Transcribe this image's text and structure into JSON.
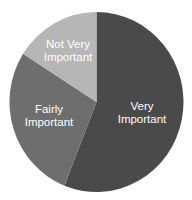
{
  "chart_data": {
    "type": "pie",
    "title": "",
    "categories": [
      "Very Important",
      "Fairly Important",
      "Not Very Important"
    ],
    "values": [
      56,
      28,
      16
    ],
    "unit": "percent (estimated from slice angles)",
    "start_angle_deg": 0,
    "direction": "clockwise",
    "colors": [
      "#4a4a4a",
      "#6e6e6e",
      "#b6b6b6"
    ],
    "labels": [
      {
        "lines": [
          "Very",
          "Important"
        ],
        "color": "#ffffff"
      },
      {
        "lines": [
          "Fairly",
          "Important"
        ],
        "color": "#ffffff"
      },
      {
        "lines": [
          "Not Very",
          "Important"
        ],
        "color": "#ffffff"
      }
    ],
    "legend": "none (labels inside slices)"
  }
}
